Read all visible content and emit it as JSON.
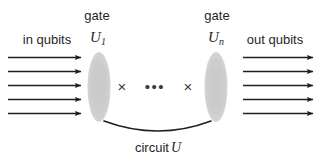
{
  "figure": {
    "background_color": "#ffffff",
    "ink_color": "#1f1f1f",
    "gate_fill_color": "#cfcfcf"
  },
  "labels": {
    "gate_left": "gate",
    "gate_right": "gate",
    "in_qubits": "in qubits",
    "out_qubits": "out qubits",
    "gate_left_symbol": "U",
    "gate_left_subscript": "1",
    "gate_right_symbol": "U",
    "gate_right_subscript": "n",
    "circuit_caption": "circuit",
    "circuit_symbol": "U",
    "ellipsis": "•••",
    "cross_left": "×",
    "cross_right": "×"
  },
  "diagram": {
    "in_arrow_count": 5,
    "out_arrow_count": 5,
    "gate_count_visible": 2,
    "cross_count": 2
  }
}
